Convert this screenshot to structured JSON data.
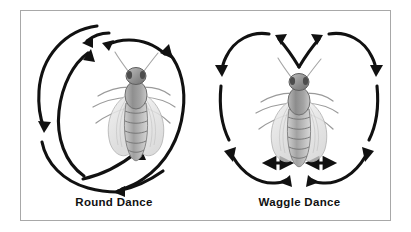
{
  "figure": {
    "title_visible": false,
    "background_color": "#ffffff",
    "frame_border_color": "#a8a8a8",
    "ink_color": "#111111"
  },
  "panels": [
    {
      "id": "round-dance",
      "caption": "Round Dance",
      "bee_label": "honeybee-illustration",
      "arrow_count": 6,
      "pattern": "overlapping-circular-loops"
    },
    {
      "id": "waggle-dance",
      "caption": "Waggle Dance",
      "bee_label": "honeybee-illustration",
      "arrow_count": 8,
      "pattern": "figure-eight-with-waggle-run"
    }
  ],
  "icons": {
    "bee": "bee-icon",
    "arrow": "arrow-icon",
    "double_arrow": "double-headed-arrow-icon"
  }
}
